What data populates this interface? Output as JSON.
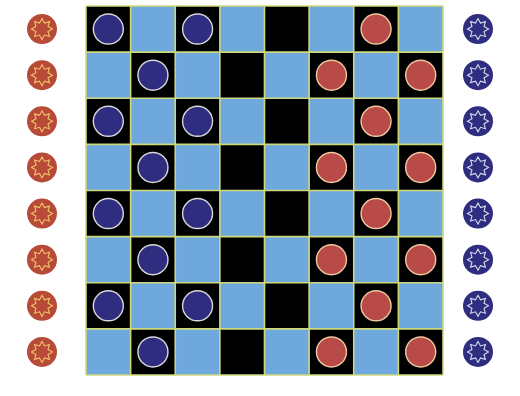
{
  "game": {
    "type": "checkers",
    "board_size": 8,
    "colors": {
      "dark_square": "#000000",
      "light_square": "#6fa8dc",
      "grid_line": "#cdd87a",
      "blue_piece": "#2e2d7f",
      "blue_piece_border": "#d8d8d8",
      "red_piece": "#b84a47",
      "red_piece_border": "#f0c9a0",
      "red_reserve": "#b84a38",
      "red_reserve_star": "#f2c46a",
      "blue_reserve": "#2e2d7f",
      "blue_reserve_star": "#d8dcec",
      "background": "#ffffff"
    },
    "board": {
      "legend": "B = blue piece, R = red piece, . = empty",
      "rows": [
        [
          "B",
          ".",
          "B",
          ".",
          ".",
          ".",
          "R",
          "."
        ],
        [
          ".",
          "B",
          ".",
          ".",
          ".",
          "R",
          ".",
          "R"
        ],
        [
          "B",
          ".",
          "B",
          ".",
          ".",
          ".",
          "R",
          "."
        ],
        [
          ".",
          "B",
          ".",
          ".",
          ".",
          "R",
          ".",
          "R"
        ],
        [
          "B",
          ".",
          "B",
          ".",
          ".",
          ".",
          "R",
          "."
        ],
        [
          ".",
          "B",
          ".",
          ".",
          ".",
          "R",
          ".",
          "R"
        ],
        [
          "B",
          ".",
          "B",
          ".",
          ".",
          ".",
          "R",
          "."
        ],
        [
          ".",
          "B",
          ".",
          ".",
          ".",
          "R",
          ".",
          "R"
        ]
      ]
    },
    "reserves": {
      "left": {
        "color": "red",
        "count": 8,
        "icon": "star-token-icon"
      },
      "right": {
        "color": "blue",
        "count": 8,
        "icon": "star-token-icon"
      }
    }
  }
}
